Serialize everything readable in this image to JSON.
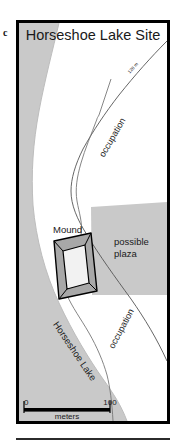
{
  "figure": {
    "panel_letter": "c",
    "title": "Horseshoe Lake Site"
  },
  "map": {
    "labels": {
      "mound": "Mound",
      "plaza_line1": "possible",
      "plaza_line2": "plaza",
      "occupation_upper": "occupation",
      "occupation_lower": "occupation",
      "lake": "Horseshoe Lake",
      "contour": "128 m"
    },
    "scale_bar": {
      "min": "0",
      "max": "100",
      "units": "meters"
    },
    "colors": {
      "water": "#c9c9c9",
      "plaza": "#c9c9c9",
      "mound_fill": "#a8a8a8",
      "mound_top": "#e6e6e6",
      "outline": "#000000",
      "background": "#ffffff"
    }
  }
}
